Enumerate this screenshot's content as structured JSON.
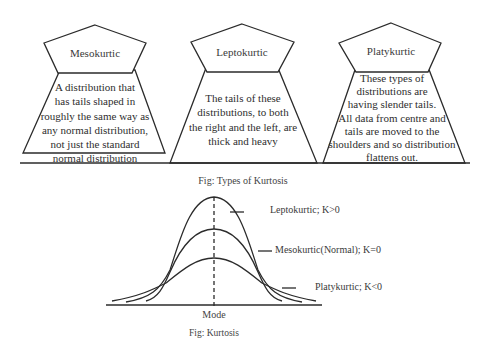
{
  "boxes": [
    {
      "title": "Mesokurtic",
      "description": "A distribution that has tails shaped in roughly the same way as any normal distribution, not just the standard normal distribution",
      "lines": [
        "A distribution that",
        "has tails shaped in",
        "roughly the same way as",
        "any normal distribution,",
        "not just the standard",
        "normal distribution"
      ]
    },
    {
      "title": "Leptokurtic",
      "description": "The tails of these distributions, to both the right and the left, are thick and heavy",
      "lines": [
        "The tails of these",
        "distributions, to both",
        "the right and the left, are",
        "thick and heavy"
      ]
    },
    {
      "title": "Platykurtic",
      "description": "These types of distributions are having slender tails. All data from centre and tails are moved to the shoulders and so distribution flattens out.",
      "lines": [
        "These types of",
        "distributions are",
        "having slender tails.",
        "All data from centre and",
        "tails are moved to the",
        "shoulders and so distribution",
        "flattens out."
      ]
    }
  ],
  "top_caption": "Fig: Types of Kurtosis",
  "curve_figure": {
    "labels": {
      "leptokurtic": "Leptokurtic; K>0",
      "mesokurtic": "Mesokurtic(Normal); K=0",
      "platykurtic": "Platykurtic; K<0"
    },
    "axis_label": "Mode",
    "caption": "Fig: Kurtosis"
  },
  "colors": {
    "line": "#2b2b2b",
    "text": "#333333",
    "background": "#ffffff"
  }
}
